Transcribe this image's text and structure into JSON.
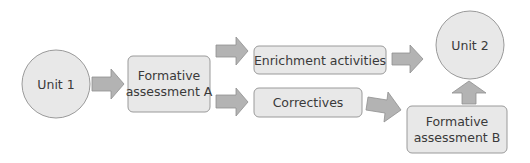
{
  "colors": {
    "node_fill": "#e8e8e8",
    "node_stroke": "#9a9a9a",
    "arrow_fill": "#b3b3b3",
    "arrow_stroke": "#8f8f8f",
    "text": "#3a3a3a"
  },
  "nodes": {
    "unit1": {
      "label": "Unit 1",
      "shape": "circle"
    },
    "formative_a": {
      "line1": "Formative",
      "line2": "assessment A",
      "shape": "rounded-rect"
    },
    "enrichment": {
      "label": "Enrichment activities",
      "shape": "rounded-rect"
    },
    "correctives": {
      "label": "Correctives",
      "shape": "rounded-rect"
    },
    "unit2": {
      "label": "Unit 2",
      "shape": "circle"
    },
    "formative_b": {
      "line1": "Formative",
      "line2": "assessment B",
      "shape": "rounded-rect"
    }
  },
  "edges": [
    {
      "from": "Unit 1",
      "to": "Formative assessment A"
    },
    {
      "from": "Formative assessment A",
      "to": "Enrichment activities"
    },
    {
      "from": "Formative assessment A",
      "to": "Correctives"
    },
    {
      "from": "Enrichment activities",
      "to": "Unit 2"
    },
    {
      "from": "Correctives",
      "to": "Formative assessment B"
    },
    {
      "from": "Formative assessment B",
      "to": "Unit 2"
    }
  ]
}
